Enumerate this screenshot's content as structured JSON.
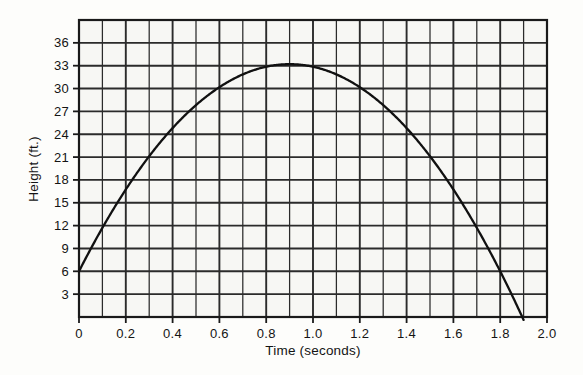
{
  "figure": {
    "background_color": "#fdfdfb",
    "plot_background_color": "#f7f7f4",
    "grid_color": "#2b2b2b",
    "curve_color": "#111111",
    "border_color": "#1a1a1a"
  },
  "chart_data": {
    "type": "line",
    "title": "",
    "subtitle": "",
    "xlabel": "Time (seconds)",
    "ylabel": "Height (ft.)",
    "xlim": [
      0,
      2.0
    ],
    "ylim": [
      0,
      39
    ],
    "x_tick_labels": [
      "0",
      "0.2",
      "0.4",
      "0.6",
      "0.8",
      "1.0",
      "1.2",
      "1.4",
      "1.6",
      "1.8",
      "2.0"
    ],
    "x_tick_values": [
      0,
      0.2,
      0.4,
      0.6,
      0.8,
      1.0,
      1.2,
      1.4,
      1.6,
      1.8,
      2.0
    ],
    "y_tick_labels": [
      "3",
      "6",
      "9",
      "12",
      "15",
      "18",
      "21",
      "24",
      "27",
      "30",
      "33",
      "36"
    ],
    "y_tick_values": [
      3,
      6,
      9,
      12,
      15,
      18,
      21,
      24,
      27,
      30,
      33,
      36
    ],
    "grid": true,
    "grid_x_step": 0.1,
    "grid_y_step": 3,
    "legend": null,
    "legend_position": "none",
    "annotations": [],
    "series": [
      {
        "name": "Height of object",
        "equation": "h(t) = 6 + 60t - 32t^2",
        "x": [
          0,
          0.1,
          0.2,
          0.3,
          0.4,
          0.5,
          0.6,
          0.7,
          0.8,
          0.9,
          1.0,
          1.1,
          1.2,
          1.3,
          1.4,
          1.5,
          1.6,
          1.7,
          1.8,
          1.9
        ],
        "values": [
          6.0,
          11.7,
          16.7,
          21.1,
          24.9,
          28.0,
          30.5,
          32.3,
          33.5,
          34.1,
          34.0,
          33.3,
          31.9,
          29.9,
          27.3,
          24.0,
          20.1,
          15.5,
          10.3,
          4.5
        ]
      }
    ],
    "curve_start_point": {
      "x": 0,
      "y": 6
    },
    "curve_peak_point": {
      "x": 0.9,
      "y": 33.2
    },
    "curve_end_point": {
      "x": 1.9,
      "y": 0
    }
  },
  "labels": {
    "y_axis_title": "Height (ft.)",
    "x_axis_title": "Time (seconds)"
  }
}
